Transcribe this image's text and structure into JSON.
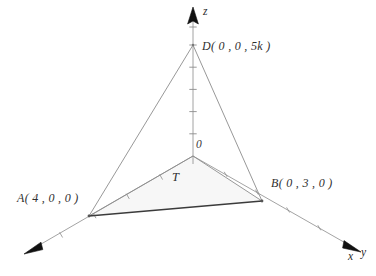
{
  "figure": {
    "type": "3d-coordinate-diagram",
    "background_color": "#ffffff",
    "line_color": "#8c8c8c",
    "edge_highlight_color": "#333333",
    "shade_color": "#f7f7f7",
    "text_color": "#2f2f2f"
  },
  "axes": {
    "x": {
      "letter": "x",
      "direction": "down-left",
      "tick_count": 5,
      "arrow": "arrowhead-x"
    },
    "y": {
      "letter": "y",
      "direction": "down-right",
      "tick_count": 5,
      "arrow": "arrowhead-y"
    },
    "z": {
      "letter": "z",
      "direction": "up",
      "tick_count": 6,
      "arrow": "arrowhead-z"
    }
  },
  "labels": {
    "origin": "0",
    "vertex_a": "A( 4 , 0 , 0 )",
    "vertex_b": "B( 0 , 3 , 0 )",
    "vertex_d": "D( 0 , 0 , 5k )",
    "region_t": "T"
  },
  "points": {
    "origin": {
      "name": "O",
      "x": 0,
      "y": 0,
      "z": 0,
      "px": 193,
      "py": 156
    },
    "a": {
      "name": "A",
      "x": 4,
      "y": 0,
      "z": 0,
      "px": 89,
      "py": 216
    },
    "b": {
      "name": "B",
      "x": 0,
      "y": 3,
      "z": 0,
      "px": 262,
      "py": 201
    },
    "d": {
      "name": "D",
      "x": 0,
      "y": 0,
      "z": "5k",
      "px": 193,
      "py": 45
    }
  }
}
